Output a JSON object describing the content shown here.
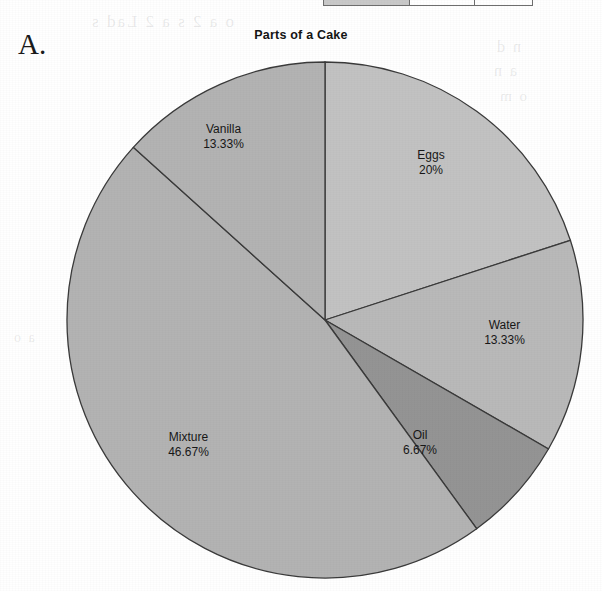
{
  "figure": {
    "label": "A."
  },
  "table_fragment": {
    "cells": [
      "",
      "",
      ""
    ]
  },
  "ghost_text": {
    "top": "o a 2 s a 2 Lad s",
    "right_1": "n d",
    "right_2": "a n",
    "right_3": "o m",
    "left": "a o",
    "bottom": "s a"
  },
  "chart_data": {
    "type": "pie",
    "title": "Parts of a Cake",
    "labels": [
      "Eggs",
      "Water",
      "Oil",
      "Mixture",
      "Vanilla"
    ],
    "values": [
      20,
      13.33,
      6.67,
      46.67,
      13.33
    ],
    "value_labels": [
      "20%",
      "13.33%",
      "6.67%",
      "46.67%",
      "13.33%"
    ],
    "colors": [
      "#c2c2c2",
      "#b9b9b9",
      "#949494",
      "#b3b3b3",
      "#b3b3b3"
    ],
    "start_angle_deg": 0,
    "direction": "clockwise",
    "stroke": "#3a3a3a",
    "legend": "none",
    "grid": false,
    "xlabel": "",
    "ylabel": ""
  },
  "slice_labels": [
    {
      "name": "Eggs",
      "pct": "20%"
    },
    {
      "name": "Water",
      "pct": "13.33%"
    },
    {
      "name": "Oil",
      "pct": "6.67%"
    },
    {
      "name": "Mixture",
      "pct": "46.67%"
    },
    {
      "name": "Vanilla",
      "pct": "13.33%"
    }
  ]
}
